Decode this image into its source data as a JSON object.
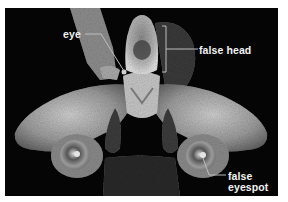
{
  "figure": {
    "labels": {
      "eye": "eye",
      "false_head": "false head",
      "false_eyespot_line1": "false",
      "false_eyespot_line2": "eyespot"
    },
    "colors": {
      "background": "#050505",
      "border": "#ffffff",
      "label_text": "#f2f2f2",
      "leader_line": "#bdbdbd"
    }
  }
}
